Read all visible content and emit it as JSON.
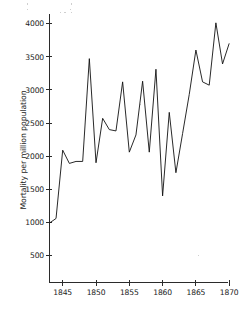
{
  "figure": {
    "background_color": "#ffffff",
    "line_color": "#111111",
    "axis_color": "#2b2b2b",
    "title": ""
  },
  "chart_data": {
    "type": "line",
    "title": "",
    "subtitle": "",
    "xlabel": "",
    "ylabel": "Mortality per million population",
    "xlim": [
      1843,
      1870
    ],
    "ylim": [
      0,
      4200
    ],
    "grid": false,
    "legend": null,
    "legend_position": "none",
    "x_ticks": [
      1845,
      1850,
      1855,
      1860,
      1865,
      1870
    ],
    "x_tick_labels": [
      "1845",
      "1850",
      "1855",
      "1860",
      "1865",
      "1870"
    ],
    "y_ticks": [
      500,
      1000,
      1500,
      2000,
      2500,
      3000,
      3500,
      4000
    ],
    "y_tick_labels": [
      "500",
      "1000",
      "1500",
      "2000",
      "2500",
      "3000",
      "3500",
      "4000"
    ],
    "series": [
      {
        "name": "Mortality per million population",
        "color": "#111111",
        "x": [
          1843,
          1844,
          1845,
          1846,
          1847,
          1848,
          1849,
          1850,
          1851,
          1852,
          1853,
          1854,
          1855,
          1856,
          1857,
          1858,
          1859,
          1860,
          1861,
          1862,
          1863,
          1864,
          1865,
          1866,
          1867,
          1868,
          1869,
          1870
        ],
        "y": [
          990,
          1060,
          2090,
          1890,
          1920,
          1920,
          3470,
          1900,
          2570,
          2400,
          2380,
          3120,
          2060,
          2320,
          3130,
          2060,
          3310,
          1400,
          2660,
          1750,
          2340,
          2930,
          3600,
          3120,
          3070,
          4010,
          3390,
          3700
        ]
      }
    ],
    "annotations": []
  },
  "axis_labels": {
    "y_title": "Mortality per million population"
  }
}
